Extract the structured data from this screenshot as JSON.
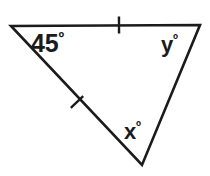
{
  "figure": {
    "kind": "geometry-diagram",
    "shape": "triangle",
    "background_color": "#ffffff",
    "stroke_color": "#1b1b1b",
    "width": 210,
    "height": 176
  },
  "vertices": {
    "top_left": {
      "x": 11,
      "y": 26
    },
    "top_right": {
      "x": 200,
      "y": 25
    },
    "bottom": {
      "x": 142,
      "y": 165
    }
  },
  "sides": [
    {
      "name": "top-side",
      "from": "top_left",
      "to": "top_right",
      "tick_marks": 1,
      "tick_center": {
        "x": 119,
        "y": 25
      }
    },
    {
      "name": "left-side",
      "from": "top_left",
      "to": "bottom",
      "tick_marks": 1,
      "tick_center": {
        "x": 77,
        "y": 102
      }
    },
    {
      "name": "right-side",
      "from": "top_right",
      "to": "bottom",
      "tick_marks": 0,
      "tick_center": null
    }
  ],
  "labels": {
    "angle_top_left": {
      "value": "45",
      "degree": "º",
      "full": "45º"
    },
    "angle_top_right": {
      "value": "y",
      "degree": "º",
      "full": "yº"
    },
    "angle_bottom": {
      "value": "x",
      "degree": "º",
      "full": "xº"
    }
  }
}
